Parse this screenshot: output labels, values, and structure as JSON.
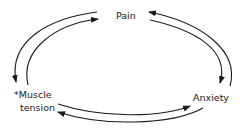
{
  "diagram": {
    "nodes": {
      "pain": "Pain",
      "muscle_line1": "*Muscle",
      "muscle_line2": "tension",
      "anxiety": "Anxiety"
    },
    "edges": [
      {
        "from": "Pain",
        "to": "Muscle tension"
      },
      {
        "from": "Muscle tension",
        "to": "Pain"
      },
      {
        "from": "Pain",
        "to": "Anxiety"
      },
      {
        "from": "Anxiety",
        "to": "Pain"
      },
      {
        "from": "Muscle tension",
        "to": "Anxiety"
      },
      {
        "from": "Anxiety",
        "to": "Muscle tension"
      }
    ],
    "colors": {
      "stroke": "#1a1a1a",
      "background": "#ffffff"
    }
  }
}
